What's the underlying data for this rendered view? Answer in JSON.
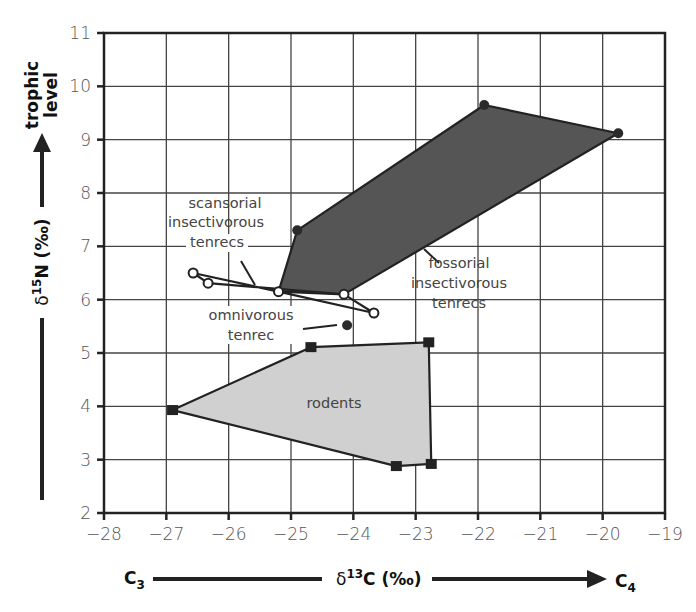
{
  "chart_data": {
    "type": "scatter",
    "title": "",
    "xlabel": "δ13C (‰)",
    "ylabel": "δ15N (‰)",
    "xlim": [
      -28,
      -19
    ],
    "ylim": [
      2,
      11
    ],
    "grid": true,
    "x_ticks": [
      "-28",
      "-27",
      "-26",
      "-25",
      "-24",
      "-23",
      "-22",
      "-21",
      "-20",
      "-19"
    ],
    "y_ticks": [
      "2",
      "3",
      "4",
      "5",
      "6",
      "7",
      "8",
      "9",
      "10",
      "11"
    ],
    "x_axis_ends": {
      "left": "C3",
      "right": "C4"
    },
    "y_axis_extra_label": "trophic level",
    "series": [
      {
        "name": "fossorial insectivorous tenrecs",
        "shape": "polygon",
        "fill": "#555555",
        "marker": "filled-circle",
        "points": [
          [
            -24.9,
            7.3
          ],
          [
            -21.9,
            9.65
          ],
          [
            -19.75,
            9.12
          ],
          [
            -24.15,
            6.1
          ],
          [
            -25.2,
            6.15
          ]
        ]
      },
      {
        "name": "scansorial insectivorous tenrecs",
        "shape": "polygon-outline",
        "fill": "#ffffff",
        "marker": "open-circle",
        "points": [
          [
            -26.57,
            6.5
          ],
          [
            -25.2,
            6.15
          ],
          [
            -23.67,
            5.75
          ],
          [
            -24.15,
            6.1
          ],
          [
            -26.33,
            6.31
          ]
        ]
      },
      {
        "name": "omnivorous tenrec",
        "shape": "point",
        "marker": "filled-circle",
        "points": [
          [
            -24.1,
            5.52
          ]
        ]
      },
      {
        "name": "rodents",
        "shape": "polygon",
        "fill": "#d0d0d0",
        "marker": "filled-square",
        "points": [
          [
            -26.9,
            3.93
          ],
          [
            -24.68,
            5.11
          ],
          [
            -22.79,
            5.2
          ],
          [
            -22.75,
            2.92
          ],
          [
            -23.31,
            2.88
          ]
        ]
      }
    ],
    "annotations": [
      {
        "lines": [
          "scansorial",
          "insectivorous",
          "tenrecs"
        ]
      },
      {
        "lines": [
          "fossorial",
          "insectivorous",
          "tenrecs"
        ]
      },
      {
        "lines": [
          "omnivorous",
          "tenrec"
        ]
      },
      {
        "lines": [
          "rodents"
        ]
      }
    ]
  },
  "labels": {
    "trophic_1": "trophic",
    "trophic_2": "level",
    "y_delta": "δ",
    "y_sup": "15",
    "y_rest": "N (‰)",
    "x_delta": "δ",
    "x_sup": "13",
    "x_rest": "C (‰)",
    "c3_main": "C",
    "c3_sub": "3",
    "c4_main": "C",
    "c4_sub": "4",
    "scansorial_1": "scansorial",
    "scansorial_2": "insectivorous",
    "scansorial_3": "tenrecs",
    "fossorial_1": "fossorial",
    "fossorial_2": "insectivorous",
    "fossorial_3": "tenrecs",
    "omni_1": "omnivorous",
    "omni_2": "tenrec",
    "rodents": "rodents"
  }
}
